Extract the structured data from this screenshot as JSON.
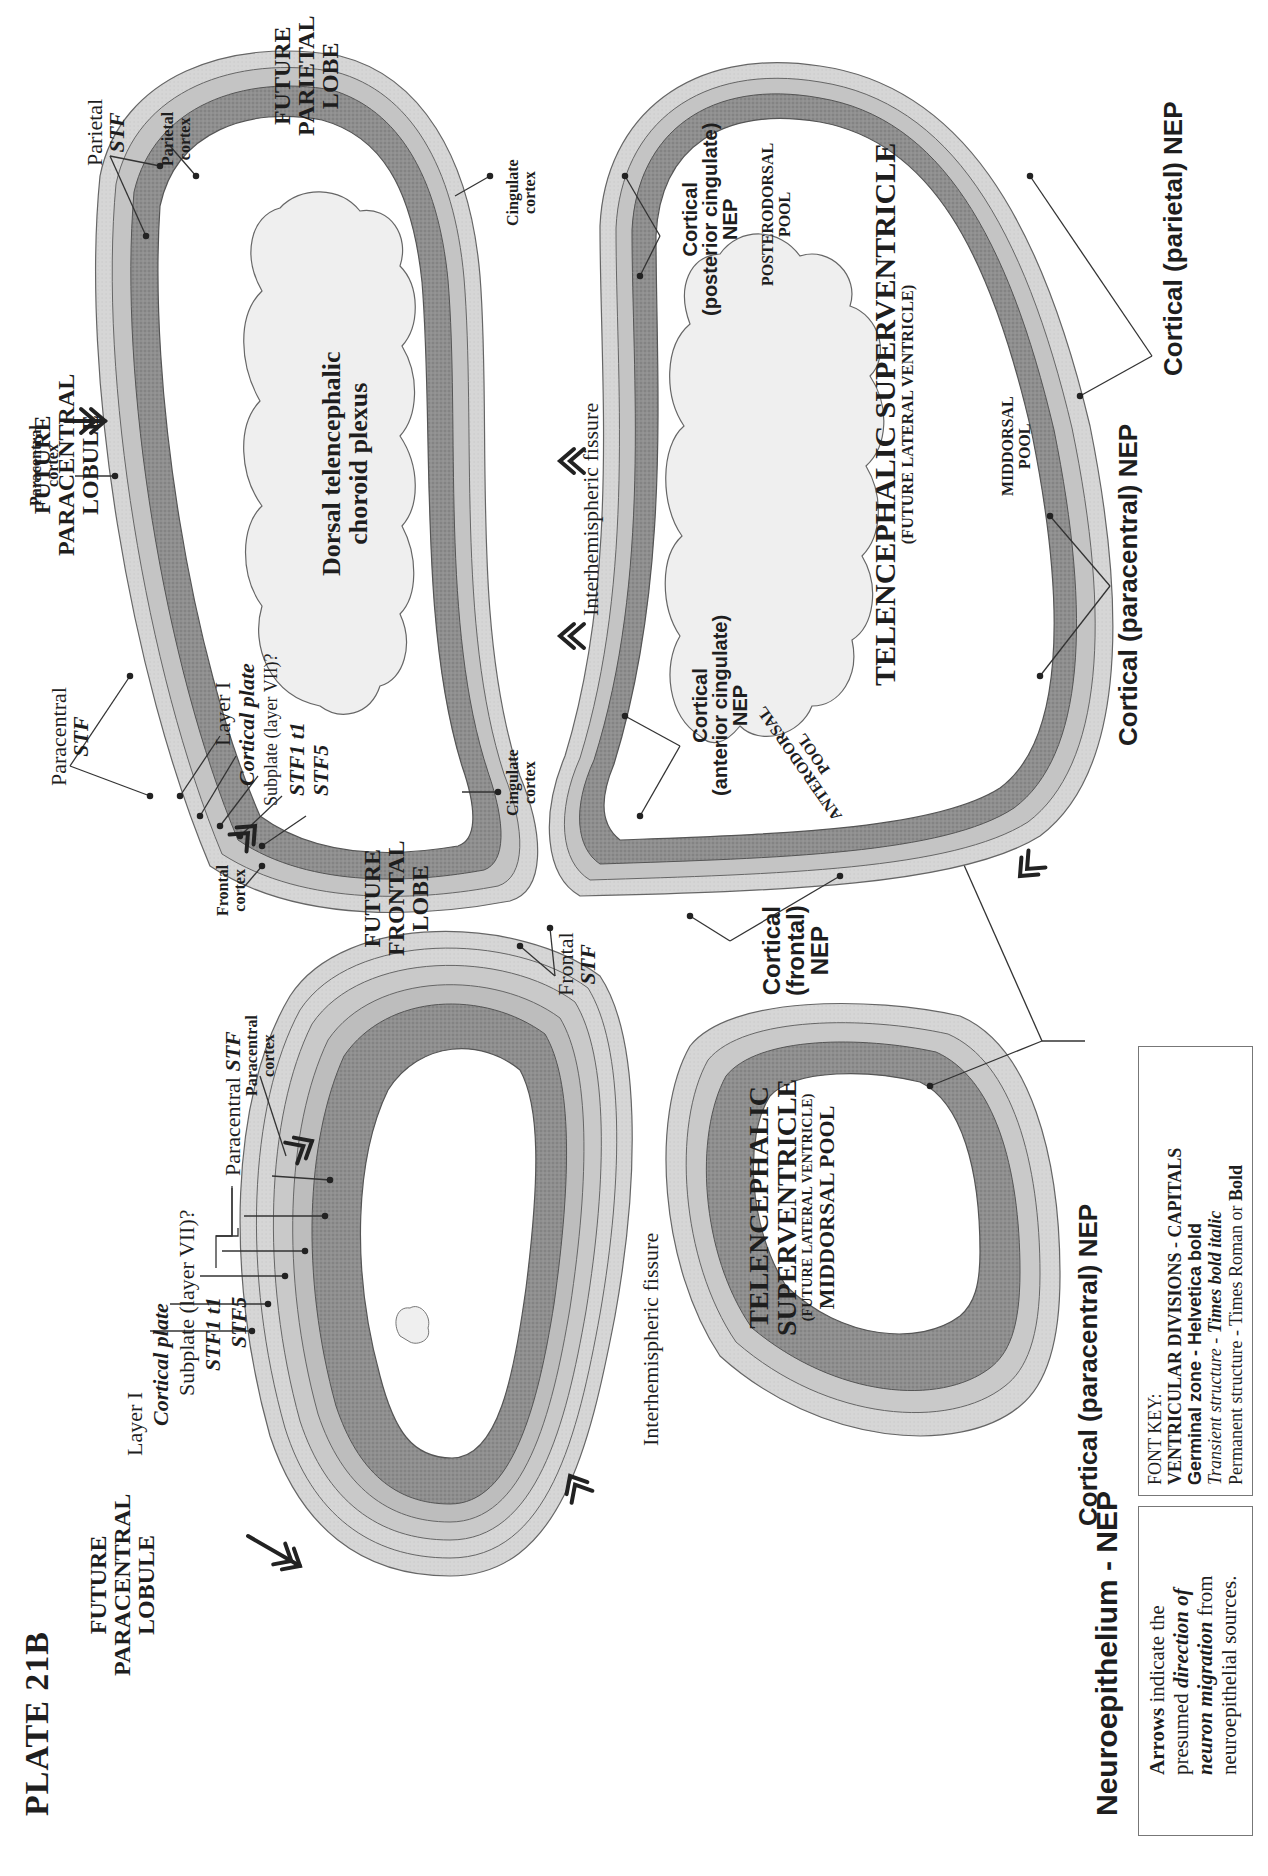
{
  "plate": {
    "title": "PLATE 21B"
  },
  "left_section": {
    "region_label": [
      "FUTURE",
      "PARACENTRAL",
      "LOBULE"
    ],
    "layers": {
      "layer_i": "Layer I",
      "cortical_plate": "Cortical plate",
      "subplate": "Subplate (layer VII)?",
      "stf1_t1": "STF1 t1",
      "stf5": "STF5",
      "paracentral_stf": "Paracentral STF",
      "paracentral_stf_prefix": "Paracentral ",
      "paracentral_stf_suffix": "STF"
    },
    "paracentral_cortex": [
      "Paracentral",
      "cortex"
    ],
    "fissure": "Interhemispheric fissure",
    "ventricle": {
      "title_line1": "TELENCEPHALIC",
      "title_line2": "SUPERVENTRICLE",
      "subtitle": "(FUTURE LATERAL VENTRICLE)",
      "pool": "MIDDORSAL POOL"
    },
    "nep_label": "Cortical (paracentral) NEP"
  },
  "right_section": {
    "regions": {
      "paracentral": [
        "FUTURE",
        "PARACENTRAL",
        "LOBULE"
      ],
      "parietal": [
        "FUTURE",
        "PARIETAL",
        "LOBE"
      ],
      "frontal": [
        "FUTURE",
        "FRONTAL",
        "LOBE"
      ]
    },
    "permanent": {
      "paracentral_cortex": [
        "Paracentral",
        "cortex"
      ],
      "parietal_cortex": [
        "Parietal",
        "cortex"
      ],
      "frontal_cortex": [
        "Frontal",
        "cortex"
      ],
      "cingulate_cortex_upper": [
        "Cingulate",
        "cortex"
      ],
      "cingulate_cortex_lower": [
        "Cingulate",
        "cortex"
      ]
    },
    "stf": {
      "parietal": [
        "Parietal",
        "STF"
      ],
      "paracentral": [
        "Paracentral",
        "STF"
      ],
      "frontal": [
        "Frontal",
        "STF"
      ]
    },
    "layers": {
      "layer_i": "Layer I",
      "cortical_plate": "Cortical plate",
      "subplate": "Subplate (layer VII)?",
      "stf1_t1": "STF1 t1",
      "stf5": "STF5"
    },
    "choroid": [
      "Dorsal telencephalic",
      "choroid plexus"
    ],
    "fissure": "Interhemispheric fissure",
    "ventricle": {
      "title": "TELENCEPHALIC SUPERVENTRICLE",
      "subtitle": "(FUTURE LATERAL VENTRICLE)"
    },
    "pools": {
      "posterodorsal": [
        "POSTERODORSAL",
        "POOL"
      ],
      "middorsal": [
        "MIDDORSAL",
        "POOL"
      ],
      "anterodorsal": [
        "ANTERODORSAL",
        "POOL"
      ]
    },
    "nep": {
      "posterior_cingulate": [
        "Cortical",
        "(posterior cingulate)",
        "NEP"
      ],
      "anterior_cingulate": [
        "Cortical",
        "(anterior cingulate)",
        "NEP"
      ],
      "frontal": [
        "Cortical",
        "(frontal)",
        "NEP"
      ],
      "paracentral": "Cortical (paracentral) NEP",
      "parietal": "Cortical (parietal) NEP"
    }
  },
  "legend": {
    "title": "Neuroepithelium - NEP",
    "arrows_box": {
      "line1_bold": "Arrows",
      "line1_rest": " indicate the",
      "line2_plain": "presumed ",
      "line2_bi": "direction of",
      "line3_bi": "neuron migration",
      "line3_rest": " from",
      "line4": "neuroepithelial sources."
    },
    "font_key": {
      "title": "FONT KEY:",
      "line1": "VENTRICULAR DIVISIONS  -  CAPITALS",
      "line2": "Germinal zone - Helvetica bold",
      "line3_i": "Transient structure",
      "line3_sep": " - ",
      "line3_bi": "Times bold italic",
      "line4_plain": "Permanent structure - Times Roman or ",
      "line4_bold": "Bold"
    }
  },
  "colors": {
    "nep_dark": "#8a8a8a",
    "stf_light": "#d2d2d2",
    "layer_mid": "#b5b5b5",
    "choroid_fill": "#eeeeee",
    "outline": "#555555",
    "text": "#1e1e1e",
    "paper": "#ffffff"
  }
}
